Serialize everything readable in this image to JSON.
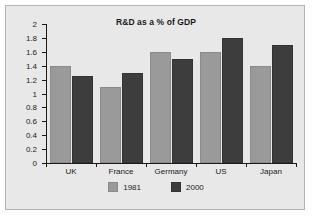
{
  "chart_data": {
    "type": "bar",
    "title": "R&D as a % of GDP",
    "xlabel": "",
    "ylabel": "",
    "categories": [
      "UK",
      "France",
      "Germany",
      "US",
      "Japan"
    ],
    "series": [
      {
        "name": "1981",
        "color": "#9a9a9a",
        "values": [
          1.4,
          1.1,
          1.6,
          1.6,
          1.4
        ]
      },
      {
        "name": "2000",
        "color": "#3d3d3d",
        "values": [
          1.25,
          1.3,
          1.5,
          1.8,
          1.7
        ]
      }
    ],
    "ylim": [
      0,
      2
    ],
    "ytick_step": 0.2,
    "ytick_labels": [
      "0",
      "0.2",
      "0.4",
      "0.6",
      "0.8",
      "1",
      "1.2",
      "1.4",
      "1.6",
      "1.8",
      "2"
    ],
    "grid": false,
    "legend_position": "bottom"
  },
  "style": {
    "plot_background": "#e8e8e8",
    "frame_border": "#b4b4b4",
    "axis_color": "#1a1a1a",
    "text_color": "#1a1a1a"
  }
}
